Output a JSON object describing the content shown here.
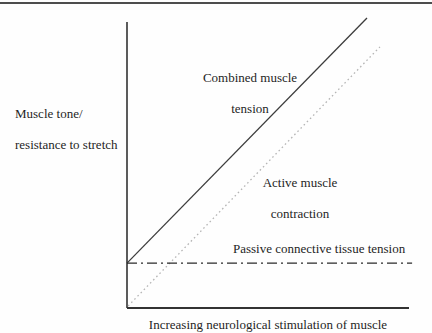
{
  "page": {
    "background": "#fefefe",
    "top_rule_color": "#4d4d4d",
    "text_color": "#1f1f1f",
    "axis_color": "#333333"
  },
  "chart_data": {
    "type": "line",
    "title": "",
    "xlabel": "Increasing neurological stimulation of muscle",
    "ylabel": "Muscle tone/ resistance to stretch",
    "axes": {
      "x_label": "Increasing neurological stimulation of muscle",
      "y_label_lines": [
        "Muscle tone/",
        "resistance to stretch"
      ],
      "x_ticks": [],
      "y_ticks": [],
      "grid": false,
      "x_range": [
        0,
        1
      ],
      "y_range": [
        0,
        1
      ],
      "note": "Qualitative axes with no tick marks or numeric scale"
    },
    "legend": "none (lines labeled inline)",
    "series": [
      {
        "name": "Combined muscle tension",
        "label_lines": [
          "Combined muscle",
          "tension"
        ],
        "style": "solid",
        "color": "#3c3c3c",
        "points_norm": [
          [
            0.0,
            0.157
          ],
          [
            0.851,
            1.014
          ]
        ],
        "description": "Starts on the y-axis at the passive connective tissue tension level and rises linearly at ~45 degrees"
      },
      {
        "name": "Active muscle contraction",
        "label_lines": [
          "Active muscle",
          "contraction"
        ],
        "style": "dotted",
        "color": "#b5b5b5",
        "points_norm": [
          [
            0.004,
            0.007
          ],
          [
            0.897,
            0.913
          ]
        ],
        "description": "Starts at the origin and rises linearly, parallel to and below the combined muscle tension line"
      },
      {
        "name": "Passive connective tissue tension",
        "label_lines": [
          "Passive connective tissue tension"
        ],
        "style": "dash-dot",
        "color": "#2a2a2a",
        "points_norm": [
          [
            0.0,
            0.157
          ],
          [
            1.011,
            0.157
          ]
        ],
        "description": "Horizontal line at a constant low tension level"
      }
    ]
  }
}
